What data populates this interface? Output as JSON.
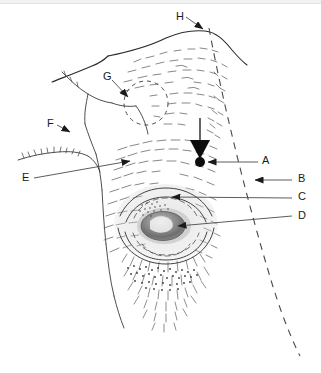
{
  "figure": {
    "type": "anatomical-line-drawing",
    "background_color": "#ffffff",
    "ink_color": "#1a1a1a",
    "hatch_color": "#555555",
    "iris_color": "#777777",
    "top_band_color": "#f2f2f2"
  },
  "labels": [
    {
      "id": "A",
      "text": "A",
      "x": 262,
      "y": 160,
      "side": "right",
      "marker": "dot-and-arrowhead",
      "target_x": 200,
      "target_y": 162
    },
    {
      "id": "B",
      "text": "B",
      "x": 298,
      "y": 177,
      "side": "right",
      "marker": "arrowhead",
      "target_x": 253,
      "target_y": 180
    },
    {
      "id": "C",
      "text": "C",
      "x": 298,
      "y": 195,
      "side": "right",
      "marker": "arrowhead",
      "target_x": 170,
      "target_y": 197
    },
    {
      "id": "D",
      "text": "D",
      "x": 298,
      "y": 214,
      "side": "right",
      "marker": "arrowhead",
      "target_x": 176,
      "target_y": 226
    },
    {
      "id": "E",
      "text": "E",
      "x": 22,
      "y": 174,
      "side": "left",
      "marker": "arrowhead",
      "target_x": 132,
      "target_y": 161
    },
    {
      "id": "F",
      "text": "F",
      "x": 47,
      "y": 120,
      "side": "left",
      "marker": "triangle",
      "target_x": 72,
      "target_y": 133
    },
    {
      "id": "G",
      "text": "G",
      "x": 103,
      "y": 73,
      "side": "left",
      "marker": "triangle",
      "target_x": 131,
      "target_y": 99
    },
    {
      "id": "H",
      "text": "H",
      "x": 176,
      "y": 14,
      "side": "top",
      "marker": "triangle",
      "target_x": 205,
      "target_y": 31
    }
  ],
  "annotations": {
    "pointer_arrow": {
      "name": "large-down-arrow",
      "stem_x": 200,
      "stem_top_y": 118,
      "stem_bottom_y": 140,
      "head_tip_y": 158,
      "head_half_width": 10
    },
    "nipple_dot": {
      "x": 200,
      "y": 162,
      "r": 5
    },
    "dashed_guide_line": {
      "start_x": 209,
      "start_y": 28,
      "end_x": 300,
      "end_y": 356,
      "dash": "7 6"
    },
    "dashed_circle": {
      "cx": 146,
      "cy": 103,
      "r": 22,
      "dash": "4 4"
    }
  }
}
